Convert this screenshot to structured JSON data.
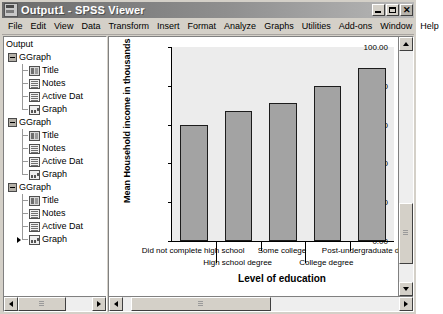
{
  "window": {
    "title": "Output1 - SPSS Viewer",
    "app_icon": "spss-viewer-icon",
    "minimize_label": "",
    "maximize_label": "",
    "close_label": "✕"
  },
  "menubar": {
    "items": [
      {
        "label": "File"
      },
      {
        "label": "Edit"
      },
      {
        "label": "View"
      },
      {
        "label": "Data"
      },
      {
        "label": "Transform"
      },
      {
        "label": "Insert"
      },
      {
        "label": "Format"
      },
      {
        "label": "Analyze"
      },
      {
        "label": "Graphs"
      },
      {
        "label": "Utilities"
      },
      {
        "label": "Add-ons"
      },
      {
        "label": "Window"
      },
      {
        "label": "Help"
      }
    ]
  },
  "outline": {
    "root": "Output",
    "nodes": [
      {
        "label": "GGraph",
        "type": "group",
        "children": [
          {
            "label": "Title",
            "icon": "title-icon"
          },
          {
            "label": "Notes",
            "icon": "notes-icon"
          },
          {
            "label": "Active Dat",
            "icon": "dataset-icon"
          },
          {
            "label": "Graph",
            "icon": "graph-icon"
          }
        ]
      },
      {
        "label": "GGraph",
        "type": "group",
        "children": [
          {
            "label": "Title",
            "icon": "title-icon"
          },
          {
            "label": "Notes",
            "icon": "notes-icon"
          },
          {
            "label": "Active Dat",
            "icon": "dataset-icon"
          },
          {
            "label": "Graph",
            "icon": "graph-icon"
          }
        ]
      },
      {
        "label": "GGraph",
        "type": "group",
        "children": [
          {
            "label": "Title",
            "icon": "title-icon"
          },
          {
            "label": "Notes",
            "icon": "notes-icon"
          },
          {
            "label": "Active Dat",
            "icon": "dataset-icon"
          },
          {
            "label": "Graph",
            "icon": "graph-icon",
            "selected": true
          }
        ]
      }
    ]
  },
  "chart_data": {
    "type": "bar",
    "title": "",
    "categories": [
      "Did not complete high school",
      "High school degree",
      "Some college",
      "College degree",
      "Post-undergraduate degree"
    ],
    "values": [
      60.0,
      67.0,
      71.0,
      80.0,
      89.0
    ],
    "xlabel": "Level of education",
    "ylabel": "Mean Household income in thousands",
    "ylim": [
      0,
      100
    ],
    "yticks": [
      0,
      20,
      40,
      60,
      80,
      100
    ],
    "ytick_labels": [
      "0.00",
      "20.00",
      "40.00",
      "60.00",
      "80.00",
      "100.00"
    ],
    "grid": false,
    "legend": false,
    "bar_color": "#a3a3a3",
    "bar_edge_color": "#1c1c1c",
    "plot_background": "#ececec"
  },
  "scrollbars": {
    "outline_left_arrow": "left-arrow",
    "outline_right_arrow": "right-arrow",
    "viewer_left_arrow": "left-arrow",
    "viewer_right_arrow": "right-arrow",
    "viewer_up_arrow": "up-arrow",
    "viewer_down_arrow": "down-arrow"
  }
}
